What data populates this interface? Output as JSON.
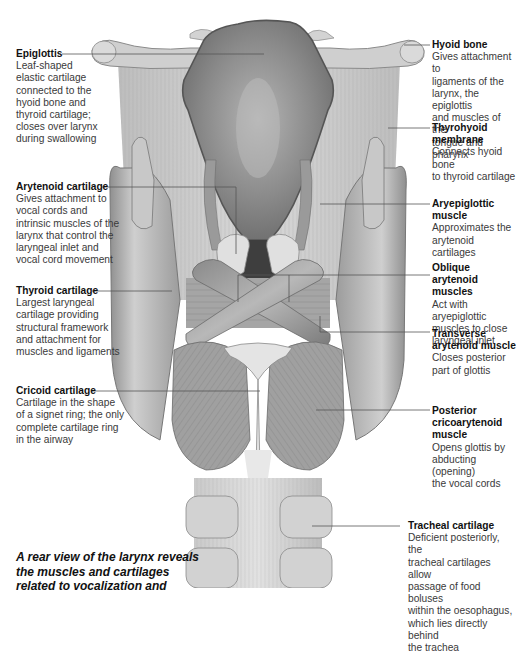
{
  "diagram": {
    "view": "rear view of the larynx",
    "caption": "A rear view of the larynx reveals\nthe muscles and cartilages\nrelated to vocalization and",
    "labels_left": [
      {
        "id": "epiglottis",
        "title": "Epiglottis",
        "desc": "Leaf-shaped\nelastic cartilage\nconnected to the\nhyoid bone and\nthyroid cartilage;\ncloses over larynx\nduring swallowing"
      },
      {
        "id": "arytenoid",
        "title": "Arytenoid cartilage",
        "desc": "Gives attachment to\nvocal cords and\nintrinsic muscles of the\nlarynx that control the\nlaryngeal inlet and\nvocal cord movement"
      },
      {
        "id": "thyroid",
        "title": "Thyroid cartilage",
        "desc": "Largest laryngeal\ncartilage providing\nstructural framework\nand attachment for\nmuscles and ligaments"
      },
      {
        "id": "cricoid",
        "title": "Cricoid cartilage",
        "desc": "Cartilage in the shape\nof a signet ring; the only\ncomplete cartilage ring\nin the airway"
      }
    ],
    "labels_right": [
      {
        "id": "hyoid",
        "title": "Hyoid bone",
        "desc": "Gives attachment to\nligaments of the\nlarynx, the epiglottis\nand muscles of the\ntongue and pharynx"
      },
      {
        "id": "thyrohyoid",
        "title": "Thyrohyoid\nmembrane",
        "desc": "Connects hyoid bone\nto thyroid cartilage"
      },
      {
        "id": "aryepiglottic",
        "title": "Aryepiglottic\nmuscle",
        "desc": "Approximates the\narytenoid cartilages"
      },
      {
        "id": "oblique",
        "title": "Oblique arytenoid\nmuscles",
        "desc": "Act with aryepiglottic\nmuscles to close\nlaryngeal inlet"
      },
      {
        "id": "transverse",
        "title": "Transverse\narytenoid muscle",
        "desc": "Closes posterior\npart of glottis"
      },
      {
        "id": "posterior",
        "title": "Posterior\ncricoarytenoid\nmuscle",
        "desc": "Opens glottis by\nabducting (opening)\nthe vocal cords"
      },
      {
        "id": "tracheal",
        "title": "Tracheal cartilage",
        "desc": "Deficient posteriorly, the\ntracheal cartilages allow\npassage of food boluses\nwithin the oesophagus,\nwhich lies directly behind\nthe trachea"
      }
    ],
    "colors": {
      "background": "#ffffff",
      "text": "#3a3a3a",
      "title": "#111111",
      "leader": "#555555",
      "tissue_light": "#d9d9d9",
      "tissue_mid": "#a8a8a8",
      "tissue_dark": "#6e6e6e"
    }
  }
}
